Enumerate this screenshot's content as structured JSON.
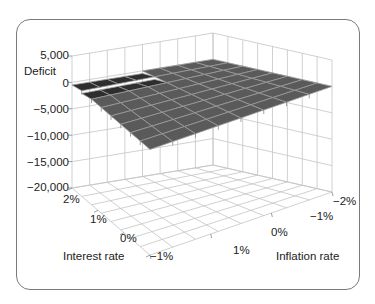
{
  "chart_data": {
    "type": "surface3d",
    "title": "",
    "zlabel": "Deficit",
    "xlabel": "Interest rate",
    "ylabel": "Inflation rate",
    "z_ticks": [
      "5,000",
      "0",
      "−5,000",
      "−10,000",
      "−15,000",
      "−20,000"
    ],
    "z_range": [
      -20000,
      5000
    ],
    "x_ticks": [
      "2%",
      "1%",
      "0%",
      "−1%"
    ],
    "y_ticks": [
      "1%",
      "0%",
      "−1%",
      "−2%"
    ],
    "grid": true,
    "surface_description": "Near-flat surface at approximately 0 deficit across all interest and inflation rates, with a slight dip near interest rate 2%/1% region",
    "surface_values_approx": 0,
    "colors": {
      "surface": "#5a5a5a",
      "surface_dark": "#2e2e2e",
      "grid": "#bdbdbd",
      "mesh": "#9a9a9a"
    }
  },
  "labels": {
    "z_title": "Deficit",
    "x_title": "Interest rate",
    "y_title": "Inflation rate",
    "z_ticks": [
      "5,000",
      "0",
      "−5,000",
      "−10,000",
      "−15,000",
      "−20,000"
    ],
    "x_ticks": [
      "2%",
      "1%",
      "0%",
      "−1%"
    ],
    "y_ticks": [
      "1%",
      "0%",
      "−1%",
      "−2%"
    ]
  }
}
